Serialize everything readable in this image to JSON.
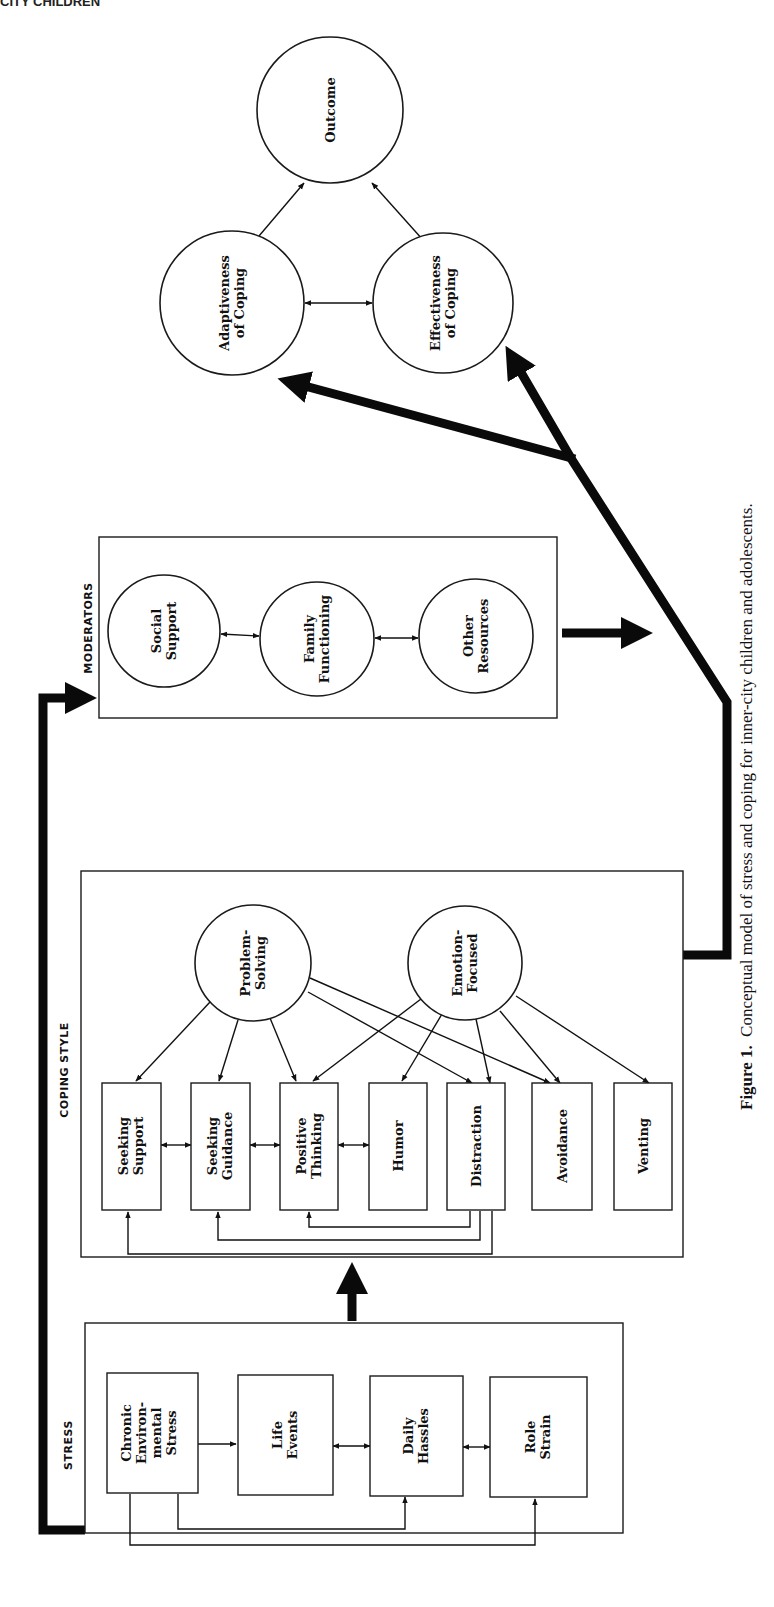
{
  "page_header": "CITY CHILDREN",
  "figure": {
    "caption_label": "Figure 1.",
    "caption_text": "Conceptual model of stress and coping for inner-city children and adolescents.",
    "orientation": "rotated 90° counter-clockwise (landscape figure on portrait page)"
  },
  "sections": {
    "stress": {
      "title": "STRESS",
      "boxes": [
        {
          "lines": [
            "Chronic",
            "Environ-",
            "mental",
            "Stress"
          ]
        },
        {
          "lines": [
            "Life",
            "Events"
          ]
        },
        {
          "lines": [
            "Daily",
            "Hassles"
          ]
        },
        {
          "lines": [
            "Role",
            "Strain"
          ]
        }
      ]
    },
    "coping_style": {
      "title": "COPING STYLE",
      "circles": [
        {
          "lines": [
            "Problem-",
            "Solving"
          ]
        },
        {
          "lines": [
            "Emotion-",
            "Focused"
          ]
        }
      ],
      "boxes": [
        {
          "lines": [
            "Seeking",
            "Support"
          ]
        },
        {
          "lines": [
            "Seeking",
            "Guidance"
          ]
        },
        {
          "lines": [
            "Positive",
            "Thinking"
          ]
        },
        {
          "lines": [
            "Humor"
          ]
        },
        {
          "lines": [
            "Distraction"
          ]
        },
        {
          "lines": [
            "Avoidance"
          ]
        },
        {
          "lines": [
            "Venting"
          ]
        }
      ]
    },
    "moderators": {
      "title": "MODERATORS",
      "circles": [
        {
          "lines": [
            "Social",
            "Support"
          ]
        },
        {
          "lines": [
            "Family",
            "Functioning"
          ]
        },
        {
          "lines": [
            "Other",
            "Resources"
          ]
        }
      ]
    },
    "outcomes": {
      "circles": [
        {
          "lines": [
            "Adaptiveness",
            "of Coping"
          ]
        },
        {
          "lines": [
            "Effectiveness",
            "of Coping"
          ]
        },
        {
          "lines": [
            "Outcome"
          ]
        }
      ]
    }
  },
  "relations": [
    {
      "from": "Chronic Environmental Stress",
      "to": "Life Events",
      "type": "directed"
    },
    {
      "from": "Life Events",
      "to": "Daily Hassles",
      "type": "bidirectional"
    },
    {
      "from": "Daily Hassles",
      "to": "Role Strain",
      "type": "bidirectional"
    },
    {
      "from": "Chronic Environmental Stress",
      "to": "Daily Hassles",
      "type": "directed"
    },
    {
      "from": "Chronic Environmental Stress",
      "to": "Role Strain",
      "type": "directed"
    },
    {
      "from": "STRESS",
      "to": "COPING STYLE",
      "type": "directed-thick"
    },
    {
      "from": "STRESS",
      "to": "MODERATORS",
      "type": "directed-thick"
    },
    {
      "from": "Problem-Solving",
      "to": "Seeking Support",
      "type": "directed"
    },
    {
      "from": "Problem-Solving",
      "to": "Seeking Guidance",
      "type": "directed"
    },
    {
      "from": "Problem-Solving",
      "to": "Positive Thinking",
      "type": "directed"
    },
    {
      "from": "Problem-Solving",
      "to": "Distraction",
      "type": "directed"
    },
    {
      "from": "Problem-Solving",
      "to": "Avoidance",
      "type": "directed"
    },
    {
      "from": "Emotion-Focused",
      "to": "Positive Thinking",
      "type": "directed"
    },
    {
      "from": "Emotion-Focused",
      "to": "Humor",
      "type": "directed"
    },
    {
      "from": "Emotion-Focused",
      "to": "Distraction",
      "type": "directed"
    },
    {
      "from": "Emotion-Focused",
      "to": "Avoidance",
      "type": "directed"
    },
    {
      "from": "Emotion-Focused",
      "to": "Venting",
      "type": "directed"
    },
    {
      "from": "Seeking Support",
      "to": "Seeking Guidance",
      "type": "bidirectional"
    },
    {
      "from": "Seeking Guidance",
      "to": "Positive Thinking",
      "type": "bidirectional"
    },
    {
      "from": "Positive Thinking",
      "to": "Humor",
      "type": "bidirectional"
    },
    {
      "from": "Distraction",
      "to": "Positive Thinking",
      "type": "directed"
    },
    {
      "from": "Distraction",
      "to": "Seeking Guidance",
      "type": "directed"
    },
    {
      "from": "Distraction",
      "to": "Seeking Support",
      "type": "directed"
    },
    {
      "from": "Social Support",
      "to": "Family Functioning",
      "type": "bidirectional"
    },
    {
      "from": "Family Functioning",
      "to": "Other Resources",
      "type": "bidirectional"
    },
    {
      "from": "MODERATORS",
      "to": "COPING→OUTCOME path",
      "type": "directed-thick"
    },
    {
      "from": "COPING STYLE",
      "to": "Adaptiveness of Coping",
      "type": "directed-thick"
    },
    {
      "from": "COPING STYLE",
      "to": "Effectiveness of Coping",
      "type": "directed-thick"
    },
    {
      "from": "Adaptiveness of Coping",
      "to": "Effectiveness of Coping",
      "type": "bidirectional"
    },
    {
      "from": "Adaptiveness of Coping",
      "to": "Outcome",
      "type": "directed"
    },
    {
      "from": "Effectiveness of Coping",
      "to": "Outcome",
      "type": "directed"
    }
  ]
}
